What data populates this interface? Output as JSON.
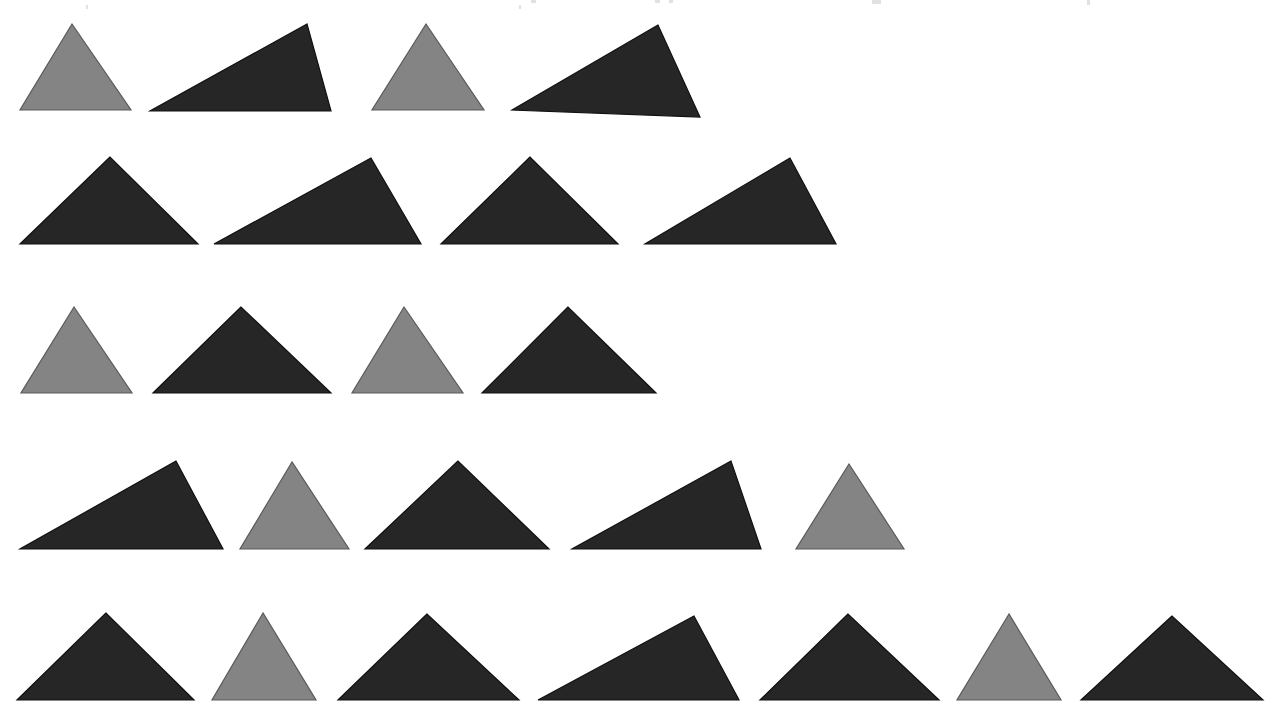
{
  "figure": {
    "background_color": "#ffffff",
    "width": 1276,
    "height": 720,
    "shape_kind": "triangle",
    "total_shapes": 24,
    "row_count": 5,
    "colors": {
      "dark": "#262626",
      "gray": "#848484",
      "dark_outline": "#111111",
      "gray_outline": "#5a5a5a",
      "background": "#ffffff"
    },
    "color_counts": {
      "dark": 17,
      "gray": 7
    },
    "legend": [
      {
        "key": "dark",
        "label": "dark triangle",
        "color": "#262626",
        "count": 17
      },
      {
        "key": "gray",
        "label": "gray triangle",
        "color": "#848484",
        "count": 7
      }
    ]
  },
  "rows": [
    {
      "index": 1,
      "label": "row-1",
      "count": 4,
      "baseline_y": 110,
      "shapes": [
        {
          "id": "r1s1",
          "color": "dark_or_gray",
          "tone": "gray",
          "apex": [
            72,
            24
          ],
          "left": [
            20,
            110
          ],
          "right": [
            131,
            110
          ],
          "width": 111,
          "height": 86,
          "form": "isosceles"
        },
        {
          "id": "r1s2",
          "color": "dark_or_gray",
          "tone": "dark",
          "apex": [
            307,
            24
          ],
          "left": [
            150,
            111
          ],
          "right": [
            331,
            111
          ],
          "width": 181,
          "height": 87,
          "form": "right-leaning-scalene"
        },
        {
          "id": "r1s3",
          "color": "dark_or_gray",
          "tone": "gray",
          "apex": [
            426,
            24
          ],
          "left": [
            372,
            110
          ],
          "right": [
            484,
            110
          ],
          "width": 112,
          "height": 86,
          "form": "isosceles"
        },
        {
          "id": "r1s4",
          "color": "dark_or_gray",
          "tone": "dark",
          "apex": [
            658,
            25
          ],
          "left": [
            512,
            110
          ],
          "right": [
            700,
            117
          ],
          "width": 188,
          "height": 92,
          "form": "right-leaning-scalene"
        }
      ]
    },
    {
      "index": 2,
      "label": "row-2",
      "count": 4,
      "baseline_y": 243,
      "shapes": [
        {
          "id": "r2s1",
          "color": "dark_or_gray",
          "tone": "dark",
          "apex": [
            110,
            157
          ],
          "left": [
            20,
            244
          ],
          "right": [
            198,
            244
          ],
          "width": 178,
          "height": 87,
          "form": "isosceles"
        },
        {
          "id": "r2s2",
          "color": "dark_or_gray",
          "tone": "dark",
          "apex": [
            371,
            158
          ],
          "left": [
            214,
            244
          ],
          "right": [
            421,
            244
          ],
          "width": 207,
          "height": 86,
          "form": "right-leaning-scalene"
        },
        {
          "id": "r2s3",
          "color": "dark_or_gray",
          "tone": "dark",
          "apex": [
            530,
            157
          ],
          "left": [
            441,
            244
          ],
          "right": [
            618,
            244
          ],
          "width": 177,
          "height": 87,
          "form": "isosceles"
        },
        {
          "id": "r2s4",
          "color": "dark_or_gray",
          "tone": "dark",
          "apex": [
            790,
            158
          ],
          "left": [
            645,
            244
          ],
          "right": [
            836,
            244
          ],
          "width": 191,
          "height": 86,
          "form": "right-leaning-scalene"
        }
      ]
    },
    {
      "index": 3,
      "label": "row-3",
      "count": 4,
      "baseline_y": 392,
      "shapes": [
        {
          "id": "r3s1",
          "color": "dark_or_gray",
          "tone": "gray",
          "apex": [
            74,
            307
          ],
          "left": [
            21,
            393
          ],
          "right": [
            132,
            393
          ],
          "width": 111,
          "height": 86,
          "form": "isosceles"
        },
        {
          "id": "r3s2",
          "color": "dark_or_gray",
          "tone": "dark",
          "apex": [
            241,
            307
          ],
          "left": [
            153,
            393
          ],
          "right": [
            331,
            393
          ],
          "width": 178,
          "height": 86,
          "form": "isosceles"
        },
        {
          "id": "r3s3",
          "color": "dark_or_gray",
          "tone": "gray",
          "apex": [
            404,
            307
          ],
          "left": [
            352,
            393
          ],
          "right": [
            463,
            393
          ],
          "width": 111,
          "height": 86,
          "form": "isosceles"
        },
        {
          "id": "r3s4",
          "color": "dark_or_gray",
          "tone": "dark",
          "apex": [
            568,
            307
          ],
          "left": [
            482,
            393
          ],
          "right": [
            656,
            393
          ],
          "width": 174,
          "height": 86,
          "form": "isosceles"
        }
      ]
    },
    {
      "index": 4,
      "label": "row-4",
      "count": 5,
      "baseline_y": 548,
      "shapes": [
        {
          "id": "r4s1",
          "color": "dark_or_gray",
          "tone": "dark",
          "apex": [
            176,
            461
          ],
          "left": [
            20,
            549
          ],
          "right": [
            223,
            549
          ],
          "width": 203,
          "height": 88,
          "form": "right-leaning-scalene"
        },
        {
          "id": "r4s2",
          "color": "dark_or_gray",
          "tone": "gray",
          "apex": [
            292,
            462
          ],
          "left": [
            240,
            549
          ],
          "right": [
            349,
            549
          ],
          "width": 109,
          "height": 87,
          "form": "isosceles"
        },
        {
          "id": "r4s3",
          "color": "dark_or_gray",
          "tone": "dark",
          "apex": [
            458,
            461
          ],
          "left": [
            365,
            549
          ],
          "right": [
            549,
            549
          ],
          "width": 184,
          "height": 88,
          "form": "isosceles"
        },
        {
          "id": "r4s4",
          "color": "dark_or_gray",
          "tone": "dark",
          "apex": [
            731,
            461
          ],
          "left": [
            572,
            549
          ],
          "right": [
            761,
            549
          ],
          "width": 189,
          "height": 88,
          "form": "right-leaning-scalene"
        },
        {
          "id": "r4s5",
          "color": "dark_or_gray",
          "tone": "gray",
          "apex": [
            849,
            464
          ],
          "left": [
            796,
            549
          ],
          "right": [
            904,
            549
          ],
          "width": 108,
          "height": 85,
          "form": "isosceles"
        }
      ]
    },
    {
      "index": 5,
      "label": "row-5",
      "count": 7,
      "baseline_y": 699,
      "shapes": [
        {
          "id": "r5s1",
          "color": "dark_or_gray",
          "tone": "dark",
          "apex": [
            106,
            613
          ],
          "left": [
            17,
            700
          ],
          "right": [
            194,
            700
          ],
          "width": 177,
          "height": 87,
          "form": "isosceles"
        },
        {
          "id": "r5s2",
          "color": "dark_or_gray",
          "tone": "gray",
          "apex": [
            263,
            613
          ],
          "left": [
            212,
            700
          ],
          "right": [
            316,
            700
          ],
          "width": 104,
          "height": 87,
          "form": "isosceles"
        },
        {
          "id": "r5s3",
          "color": "dark_or_gray",
          "tone": "dark",
          "apex": [
            427,
            614
          ],
          "left": [
            338,
            700
          ],
          "right": [
            519,
            700
          ],
          "width": 181,
          "height": 86,
          "form": "isosceles"
        },
        {
          "id": "r5s4",
          "color": "dark_or_gray",
          "tone": "dark",
          "apex": [
            694,
            616
          ],
          "left": [
            538,
            700
          ],
          "right": [
            739,
            700
          ],
          "width": 201,
          "height": 84,
          "form": "right-leaning-scalene"
        },
        {
          "id": "r5s5",
          "color": "dark_or_gray",
          "tone": "dark",
          "apex": [
            848,
            614
          ],
          "left": [
            760,
            700
          ],
          "right": [
            939,
            700
          ],
          "width": 179,
          "height": 86,
          "form": "isosceles"
        },
        {
          "id": "r5s6",
          "color": "dark_or_gray",
          "tone": "gray",
          "apex": [
            1009,
            614
          ],
          "left": [
            957,
            700
          ],
          "right": [
            1061,
            700
          ],
          "width": 104,
          "height": 86,
          "form": "isosceles"
        },
        {
          "id": "r5s7",
          "color": "dark_or_gray",
          "tone": "dark",
          "apex": [
            1172,
            616
          ],
          "left": [
            1081,
            700
          ],
          "right": [
            1263,
            700
          ],
          "width": 182,
          "height": 84,
          "form": "isosceles"
        }
      ]
    }
  ],
  "scan_artifacts": [
    {
      "id": "a1",
      "x": 531,
      "y": 0,
      "w": 5,
      "h": 3
    },
    {
      "id": "a2",
      "x": 655,
      "y": 0,
      "w": 5,
      "h": 3
    },
    {
      "id": "a3",
      "x": 669,
      "y": 0,
      "w": 4,
      "h": 3
    },
    {
      "id": "a4",
      "x": 872,
      "y": 0,
      "w": 9,
      "h": 4
    },
    {
      "id": "a5",
      "x": 1087,
      "y": 0,
      "w": 3,
      "h": 5
    },
    {
      "id": "a6",
      "x": 86,
      "y": 5,
      "w": 2,
      "h": 4
    },
    {
      "id": "a7",
      "x": 519,
      "y": 5,
      "w": 2,
      "h": 4
    }
  ]
}
